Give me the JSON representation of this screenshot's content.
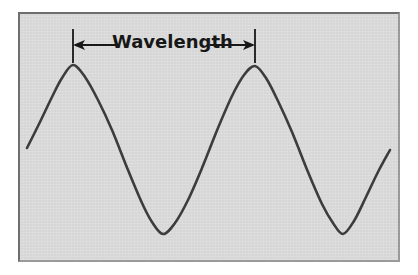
{
  "figure": {
    "background_color": "#d9d9d9",
    "page_color": "#ffffff",
    "border_color_dark": "#6e6e6e",
    "border_color_light": "#9a9a9a",
    "curve_color": "#3c3c3c",
    "annotation_color": "#171717"
  },
  "annotation": {
    "label": "Wavelength",
    "measure_from_icon": "tick-mark-left",
    "measure_to_icon": "tick-mark-right",
    "left_arrow_icon": "arrow-left-icon",
    "right_arrow_icon": "arrow-right-icon",
    "span_start_x": 73,
    "span_end_x": 255,
    "span_y": 45,
    "span_pixels": 182
  },
  "chart_data": {
    "type": "line",
    "title": "Wavelength",
    "xlabel": "",
    "ylabel": "",
    "grid": false,
    "legend": null,
    "xlim": [
      27,
      390
    ],
    "ylim": [
      65,
      234
    ],
    "series": [
      {
        "name": "sine-wave",
        "comment": "y is inverted screen space: peaks have small y, troughs large y",
        "points": [
          [
            27,
            148
          ],
          [
            40,
            122
          ],
          [
            52,
            97
          ],
          [
            62,
            78
          ],
          [
            73,
            65
          ],
          [
            85,
            77
          ],
          [
            98,
            100
          ],
          [
            112,
            130
          ],
          [
            128,
            170
          ],
          [
            142,
            203
          ],
          [
            152,
            222
          ],
          [
            163,
            234
          ],
          [
            175,
            223
          ],
          [
            188,
            200
          ],
          [
            202,
            168
          ],
          [
            218,
            128
          ],
          [
            232,
            96
          ],
          [
            244,
            75
          ],
          [
            255,
            66
          ],
          [
            266,
            78
          ],
          [
            278,
            101
          ],
          [
            292,
            132
          ],
          [
            308,
            172
          ],
          [
            322,
            204
          ],
          [
            333,
            223
          ],
          [
            343,
            234
          ],
          [
            354,
            221
          ],
          [
            366,
            197
          ],
          [
            378,
            172
          ],
          [
            390,
            150
          ]
        ]
      }
    ],
    "annotations": [
      {
        "type": "double-arrow-span",
        "text": "Wavelength",
        "from_x": 73,
        "to_x": 255,
        "y": 45
      },
      {
        "type": "vertical-tick",
        "x": 73,
        "y_top": 29,
        "y_bottom": 63
      },
      {
        "type": "vertical-tick",
        "x": 255,
        "y_top": 29,
        "y_bottom": 63
      }
    ],
    "peaks": [
      [
        73,
        65
      ],
      [
        255,
        66
      ]
    ],
    "troughs": [
      [
        163,
        234
      ],
      [
        343,
        234
      ]
    ]
  }
}
